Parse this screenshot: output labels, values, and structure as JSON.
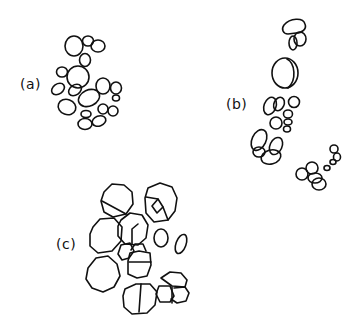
{
  "figure": {
    "panels": [
      {
        "id": "a",
        "label": "(a)"
      },
      {
        "id": "b",
        "label": "(b)"
      },
      {
        "id": "c",
        "label": "(c)"
      }
    ],
    "colors": {
      "background": "#ffffff",
      "ink": "#111111"
    }
  }
}
